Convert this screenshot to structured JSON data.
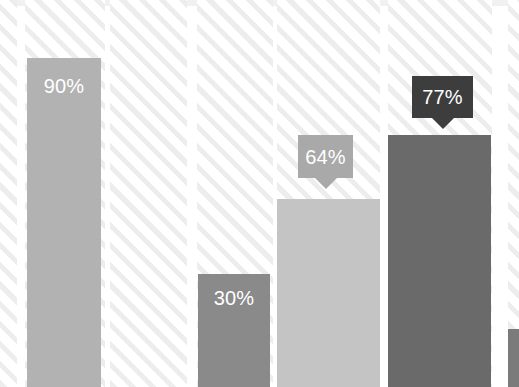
{
  "chart_data": {
    "type": "bar",
    "title": "",
    "subtitle": "",
    "xlabel": "",
    "ylabel": "",
    "ylim": [
      0,
      100
    ],
    "grid": false,
    "legend": null,
    "units": "percent",
    "categories": [
      "Bar 1",
      "Bar 2",
      "Bar 3",
      "Bar 4",
      "Bar 5"
    ],
    "values": [
      90,
      30,
      64,
      77,
      null
    ],
    "data_labels": [
      "90%",
      "30%",
      "64%",
      "77%",
      ""
    ],
    "label_style": [
      "inline",
      "inline",
      "callout",
      "callout",
      "none"
    ],
    "series": [
      {
        "name": "Values",
        "values": [
          90,
          30,
          64,
          77,
          null
        ]
      }
    ]
  },
  "colors": {
    "page_background": "#ffffff",
    "hatch_stripe": "#ededed",
    "top_band": "#e9e9e9",
    "bar_1": "#b2b2b2",
    "bar_2": "#8a8a8a",
    "bar_3": "#c4c4c4",
    "bar_4": "#6a6a6a",
    "bar_5": "#7b7b7b",
    "callout_1": "#a9a9a9",
    "callout_2": "#3d3d3d",
    "label_text": "#ffffff"
  },
  "bars": [
    {
      "id": "bar-1",
      "label": "90%",
      "value": 90,
      "color": "#b2b2b2",
      "x": 27,
      "width": 74,
      "top": 58,
      "label_mode": "inline",
      "label_top": 76
    },
    {
      "id": "bar-2",
      "label": "30%",
      "value": 30,
      "color": "#8a8a8a",
      "x": 198,
      "width": 72,
      "top": 274,
      "label_mode": "inline",
      "label_top": 288
    },
    {
      "id": "bar-3",
      "label": "64%",
      "value": 64,
      "color": "#c4c4c4",
      "x": 277,
      "width": 103,
      "top": 199,
      "label_mode": "callout",
      "label_top": 0
    },
    {
      "id": "bar-4",
      "label": "77%",
      "value": 77,
      "color": "#6a6a6a",
      "x": 388,
      "width": 103,
      "top": 135,
      "label_mode": "callout",
      "label_top": 0
    },
    {
      "id": "bar-5",
      "label": "",
      "value": null,
      "color": "#7b7b7b",
      "x": 508,
      "width": 11,
      "top": 329,
      "label_mode": "none",
      "label_top": 0
    }
  ],
  "callouts": [
    {
      "id": "callout-64",
      "label": "64%",
      "for_bar": "bar-3",
      "color": "#a9a9a9",
      "x": 298,
      "y": 135,
      "width": 55,
      "height": 43
    },
    {
      "id": "callout-77",
      "label": "77%",
      "for_bar": "bar-4",
      "color": "#3d3d3d",
      "x": 412,
      "y": 76,
      "width": 61,
      "height": 42
    }
  ],
  "tracks": [
    {
      "x": 0,
      "width": 17
    },
    {
      "x": 25,
      "width": 80
    },
    {
      "x": 110,
      "width": 77
    },
    {
      "x": 197,
      "width": 76
    },
    {
      "x": 277,
      "width": 103
    },
    {
      "x": 388,
      "width": 104
    },
    {
      "x": 508,
      "width": 11
    }
  ],
  "top_band_segments": [
    {
      "x": 0,
      "width": 17
    },
    {
      "x": 25,
      "width": 80
    },
    {
      "x": 110,
      "width": 77
    },
    {
      "x": 197,
      "width": 76
    },
    {
      "x": 277,
      "width": 103
    },
    {
      "x": 388,
      "width": 104
    },
    {
      "x": 508,
      "width": 11
    }
  ]
}
